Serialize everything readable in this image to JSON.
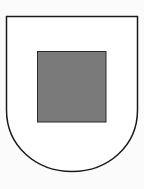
{
  "figure": {
    "colors": {
      "background": "#fbfbfb",
      "shield_fill": "#ffffff",
      "outline": "#1a1a1a",
      "square_fill": "#7a7a7a"
    }
  }
}
